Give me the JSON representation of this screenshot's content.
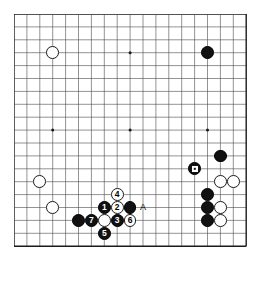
{
  "diagram": {
    "kind": "go-board-diagram",
    "board_size": 19,
    "grid": {
      "origin_x": 14,
      "origin_y": 14,
      "spacing": 12.9,
      "line_color": "#4a4a4a",
      "border_color": "#1a1a1a"
    },
    "star_points": [
      {
        "col": 3,
        "row": 3
      },
      {
        "col": 9,
        "row": 3
      },
      {
        "col": 15,
        "row": 3
      },
      {
        "col": 3,
        "row": 9
      },
      {
        "col": 9,
        "row": 9
      },
      {
        "col": 15,
        "row": 9
      },
      {
        "col": 3,
        "row": 15
      },
      {
        "col": 9,
        "row": 15
      },
      {
        "col": 15,
        "row": 15
      }
    ],
    "colors": {
      "black_stone": "#111111",
      "white_stone": "#ffffff",
      "white_stone_edge": "#1a1a1a",
      "background": "#ffffff",
      "label_text": "#000000"
    },
    "stone_radius": 6.4,
    "stones": [
      {
        "id": "w-upper-left",
        "color": "white",
        "col": 3,
        "row": 3,
        "label": ""
      },
      {
        "id": "b-upper-right",
        "color": "black",
        "col": 15,
        "row": 3,
        "label": ""
      },
      {
        "id": "w-left-upper",
        "color": "white",
        "col": 2,
        "row": 13,
        "label": ""
      },
      {
        "id": "w-left-lower",
        "color": "white",
        "col": 3,
        "row": 15,
        "label": ""
      },
      {
        "id": "b-right-upper",
        "color": "black",
        "col": 16,
        "row": 11,
        "label": ""
      },
      {
        "id": "b-right-marked",
        "color": "black",
        "col": 14,
        "row": 12,
        "label": "",
        "marker": "square"
      },
      {
        "id": "w-right-a",
        "color": "white",
        "col": 16,
        "row": 13,
        "label": ""
      },
      {
        "id": "w-right-b",
        "color": "white",
        "col": 17,
        "row": 13,
        "label": ""
      },
      {
        "id": "b-right-c1",
        "color": "black",
        "col": 15,
        "row": 14,
        "label": ""
      },
      {
        "id": "b-right-c2",
        "color": "black",
        "col": 15,
        "row": 15,
        "label": ""
      },
      {
        "id": "w-right-c2",
        "color": "white",
        "col": 16,
        "row": 15,
        "label": ""
      },
      {
        "id": "b-right-c3",
        "color": "black",
        "col": 15,
        "row": 16,
        "label": ""
      },
      {
        "id": "w-right-c3",
        "color": "white",
        "col": 16,
        "row": 16,
        "label": ""
      },
      {
        "id": "b-bottom-left-1",
        "color": "black",
        "col": 5,
        "row": 16,
        "label": ""
      },
      {
        "id": "b-move-7",
        "color": "black",
        "col": 6,
        "row": 16,
        "label": "7"
      },
      {
        "id": "w-bottom-plain",
        "color": "white",
        "col": 7,
        "row": 16,
        "label": ""
      },
      {
        "id": "b-move-1",
        "color": "black",
        "col": 7,
        "row": 15,
        "label": "1"
      },
      {
        "id": "w-move-2",
        "color": "white",
        "col": 8,
        "row": 15,
        "label": "2"
      },
      {
        "id": "w-move-4",
        "color": "white",
        "col": 8,
        "row": 14,
        "label": "4"
      },
      {
        "id": "b-move-3",
        "color": "black",
        "col": 8,
        "row": 16,
        "label": "3"
      },
      {
        "id": "w-move-6",
        "color": "white",
        "col": 9,
        "row": 16,
        "label": "6"
      },
      {
        "id": "b-move-5",
        "color": "black",
        "col": 7,
        "row": 17,
        "label": "5"
      },
      {
        "id": "b-bottom-right-a",
        "color": "black",
        "col": 9,
        "row": 15,
        "label": ""
      }
    ],
    "point_labels": [
      {
        "id": "label-a",
        "text": "A",
        "col": 10,
        "row": 15
      }
    ]
  }
}
